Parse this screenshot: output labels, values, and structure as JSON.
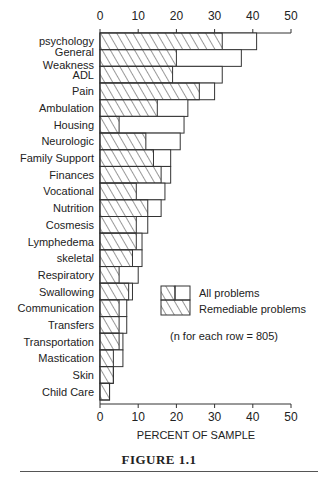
{
  "chart_data": {
    "type": "bar",
    "orientation": "horizontal",
    "title": "FIGURE 1.1",
    "xlabel": "PERCENT OF SAMPLE",
    "ylabel": "",
    "xlim": [
      0,
      50
    ],
    "xticks": [
      0,
      10,
      20,
      30,
      40,
      50
    ],
    "axis_top": true,
    "axis_bottom": true,
    "grid": false,
    "legend_position": "lower-right-inside",
    "categories": [
      "psychology",
      "General Weakness",
      "ADL",
      "Pain",
      "Ambulation",
      "Housing",
      "Neurologic",
      "Family Support",
      "Finances",
      "Vocational",
      "Nutrition",
      "Cosmesis",
      "Lymphedema",
      "skeletal",
      "Respiratory",
      "Swallowing",
      "Communication",
      "Transfers",
      "Transportation",
      "Mastication",
      "Skin",
      "Child Care"
    ],
    "series": [
      {
        "name": "All problems",
        "pattern": "open",
        "values": [
          41,
          37,
          32,
          30,
          23,
          22,
          21,
          18.5,
          18.5,
          17,
          16,
          12.5,
          11,
          11,
          10,
          8.5,
          7,
          7,
          6,
          6,
          3.5,
          2.5
        ]
      },
      {
        "name": "Remediable problems",
        "pattern": "hatched",
        "values": [
          32,
          20,
          19,
          26,
          15,
          5,
          12,
          14,
          16,
          9.5,
          12.5,
          9.5,
          9.5,
          8.5,
          5,
          7.5,
          5,
          5,
          5,
          3.5,
          3.5,
          2.5
        ]
      }
    ],
    "annotation": "(n for each row = 805)"
  },
  "chart": {
    "category_labels": [
      [
        "psychology"
      ],
      [
        "General",
        "Weakness"
      ],
      [
        "ADL"
      ],
      [
        "Pain"
      ],
      [
        "Ambulation"
      ],
      [
        "Housing"
      ],
      [
        "Neurologic"
      ],
      [
        "Family Support"
      ],
      [
        "Finances"
      ],
      [
        "Vocational"
      ],
      [
        "Nutrition"
      ],
      [
        "Cosmesis"
      ],
      [
        "Lymphedema"
      ],
      [
        "skeletal"
      ],
      [
        "Respiratory"
      ],
      [
        "Swallowing"
      ],
      [
        "Communication"
      ],
      [
        "Transfers"
      ],
      [
        "Transportation"
      ],
      [
        "Mastication"
      ],
      [
        "Skin"
      ],
      [
        "Child Care"
      ]
    ],
    "legend": {
      "all_label": "All problems",
      "remediable_label": "Remediable problems",
      "note": "(n for each row = 805)"
    },
    "colors": {
      "stroke": "#333333",
      "background": "#ffffff"
    }
  },
  "figure": {
    "caption": "FIGURE 1.1"
  }
}
